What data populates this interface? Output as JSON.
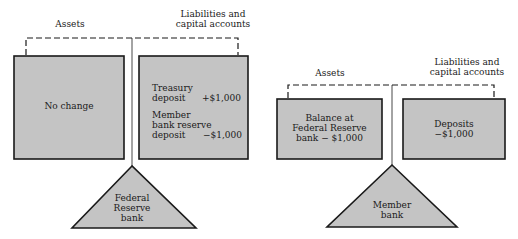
{
  "colors": {
    "box_fill": "#c4c4c4",
    "stroke": "#1a1a1a",
    "background": "#ffffff"
  },
  "left_diagram": {
    "assets_label": "Assets",
    "liabilities_label_line1": "Liabilities and",
    "liabilities_label_line2": "capital accounts",
    "assets_box": {
      "text": "No change"
    },
    "liabilities_box": {
      "rows": [
        {
          "label_line1": "Treasury",
          "label_line2": "deposit",
          "value": "+$1,000"
        },
        {
          "label_line1": "Member",
          "label_line2": "bank reserve",
          "label_line3": "deposit",
          "value": "−$1,000"
        }
      ]
    },
    "fulcrum": {
      "line1": "Federal",
      "line2": "Reserve",
      "line3": "bank"
    }
  },
  "right_diagram": {
    "assets_label": "Assets",
    "liabilities_label_line1": "Liabilities and",
    "liabilities_label_line2": "capital accounts",
    "assets_box": {
      "line1": "Balance at",
      "line2": "Federal Reserve",
      "line3": "bank − $1,000"
    },
    "liabilities_box": {
      "line1": "Deposits",
      "line2": "−$1,000"
    },
    "fulcrum": {
      "line1": "Member",
      "line2": "bank"
    }
  }
}
